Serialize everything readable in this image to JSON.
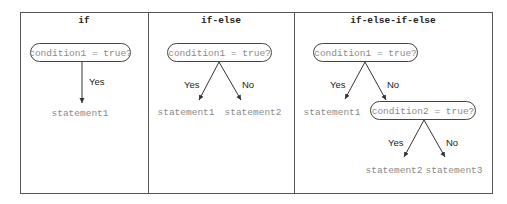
{
  "panels": [
    {
      "title": "if",
      "condition": "condition1 = true?",
      "branches": [
        {
          "label": "Yes",
          "statement": "statement1"
        }
      ]
    },
    {
      "title": "if-else",
      "condition": "condition1 = true?",
      "branches": [
        {
          "label": "Yes",
          "statement": "statement1"
        },
        {
          "label": "No",
          "statement": "statement2"
        }
      ]
    },
    {
      "title": "if-else-if-else",
      "condition": "condition1 = true?",
      "branches": [
        {
          "label": "Yes",
          "statement": "statement1"
        },
        {
          "label": "No",
          "statement": null
        }
      ],
      "nested": {
        "condition": "condition2 = true?",
        "branches": [
          {
            "label": "Yes",
            "statement": "statement2"
          },
          {
            "label": "No",
            "statement": "statement3"
          }
        ]
      }
    }
  ],
  "colors": {
    "frame": "#555555",
    "text_dark": "#222222",
    "text_code": "#8a8a8a"
  }
}
